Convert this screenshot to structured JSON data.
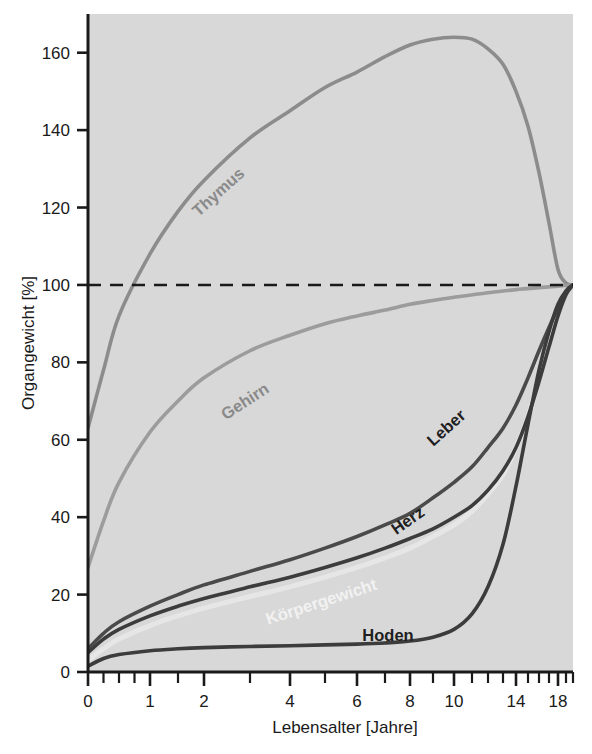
{
  "chart_data": {
    "type": "line",
    "title": "",
    "xlabel": "Lebensalter [Jahre]",
    "ylabel": "Organgewicht [%]",
    "x_tick_labels": [
      "0",
      "1",
      "2",
      "4",
      "6",
      "8",
      "10",
      "14",
      "18"
    ],
    "x_tick_values": [
      0,
      1,
      2,
      4,
      6,
      8,
      10,
      14,
      18
    ],
    "y_tick_labels": [
      "0",
      "20",
      "40",
      "60",
      "80",
      "100",
      "120",
      "140",
      "160"
    ],
    "y_tick_values": [
      0,
      20,
      40,
      60,
      80,
      100,
      120,
      140,
      160
    ],
    "xlim": [
      0,
      20
    ],
    "ylim": [
      0,
      170
    ],
    "grid": false,
    "legend": "inline-curve-labels",
    "reference_line": {
      "value": 100,
      "style": "dashed",
      "color": "#1a1a1a"
    },
    "axis_scale_note": "x-axis compressed (non-linear) toward higher ages",
    "series": [
      {
        "name": "Thymus",
        "label": "Thymus",
        "color": "#8c8c8c",
        "label_angle": -42,
        "x": [
          0,
          0.25,
          0.5,
          1,
          1.5,
          2,
          3,
          4,
          5,
          6,
          7,
          8,
          9,
          10,
          11,
          12,
          13,
          14,
          15,
          16,
          17,
          18,
          19,
          20
        ],
        "y": [
          63,
          78,
          92,
          108,
          119,
          127,
          138,
          145,
          151,
          155,
          159,
          162,
          163.5,
          164,
          163.5,
          161,
          157,
          150,
          141,
          129,
          116,
          104,
          100.5,
          100
        ]
      },
      {
        "name": "Gehirn",
        "label": "Gehirn",
        "color": "#9c9c9c",
        "label_angle": -33,
        "x": [
          0,
          0.25,
          0.5,
          1,
          1.5,
          2,
          3,
          4,
          5,
          6,
          7,
          8,
          9,
          10,
          12,
          14,
          16,
          18,
          20
        ],
        "y": [
          27,
          39,
          49,
          62,
          70,
          76,
          83,
          87,
          90,
          92,
          93.5,
          95,
          96,
          96.8,
          98,
          98.8,
          99.3,
          99.7,
          100
        ]
      },
      {
        "name": "Leber",
        "label": "Leber",
        "color": "#4a4a4a",
        "label_angle": -42,
        "x": [
          0,
          0.25,
          0.5,
          1,
          1.5,
          2,
          3,
          4,
          5,
          6,
          7,
          8,
          9,
          10,
          11,
          12,
          13,
          14,
          15,
          16,
          17,
          18,
          19,
          20
        ],
        "y": [
          6,
          10,
          13,
          17,
          20,
          22.5,
          26,
          29,
          32,
          35,
          38,
          41,
          45,
          49,
          53,
          58,
          63,
          69,
          76,
          83,
          89,
          94,
          98,
          100
        ]
      },
      {
        "name": "Herz",
        "label": "Herz",
        "color": "#3c3c3c",
        "label_angle": -35,
        "x": [
          0,
          0.25,
          0.5,
          1,
          1.5,
          2,
          3,
          4,
          5,
          6,
          7,
          8,
          9,
          10,
          11,
          12,
          13,
          14,
          15,
          16,
          17,
          18,
          19,
          20
        ],
        "y": [
          5,
          8.5,
          11,
          14.5,
          17,
          19,
          22,
          24.5,
          27,
          29.5,
          32,
          34.5,
          37,
          40,
          43,
          47,
          52,
          58,
          66,
          75,
          84,
          92,
          97.5,
          100
        ]
      },
      {
        "name": "Körpergewicht",
        "label": "Körpergewicht",
        "color": "#e6e6e6",
        "label_angle": -18,
        "x": [
          0,
          0.25,
          0.5,
          1,
          1.5,
          2,
          3,
          4,
          5,
          6,
          7,
          8,
          9,
          10,
          11,
          12,
          13,
          14,
          15,
          16,
          17,
          18,
          19,
          20
        ],
        "y": [
          3,
          6,
          8.5,
          12,
          14.5,
          16.5,
          19.5,
          22,
          24.5,
          27,
          29.5,
          32,
          35,
          38,
          41.5,
          46,
          51,
          58,
          66,
          76,
          85,
          93,
          98,
          100
        ]
      },
      {
        "name": "Hoden",
        "label": "Hoden",
        "color": "#3c3c3c",
        "label_angle": 0,
        "x": [
          0,
          0.25,
          0.5,
          1,
          1.5,
          2,
          3,
          4,
          5,
          6,
          7,
          8,
          9,
          10,
          11,
          12,
          13,
          14,
          15,
          16,
          17,
          18,
          19,
          20
        ],
        "y": [
          1.5,
          3.5,
          4.5,
          5.5,
          6,
          6.3,
          6.6,
          6.8,
          7,
          7.2,
          7.5,
          8,
          9,
          11,
          15,
          22,
          33,
          48,
          64,
          78,
          88,
          95,
          98.5,
          100
        ]
      }
    ]
  },
  "figure": {
    "background": "#ffffff",
    "plot_background": "#d8d8d8"
  }
}
